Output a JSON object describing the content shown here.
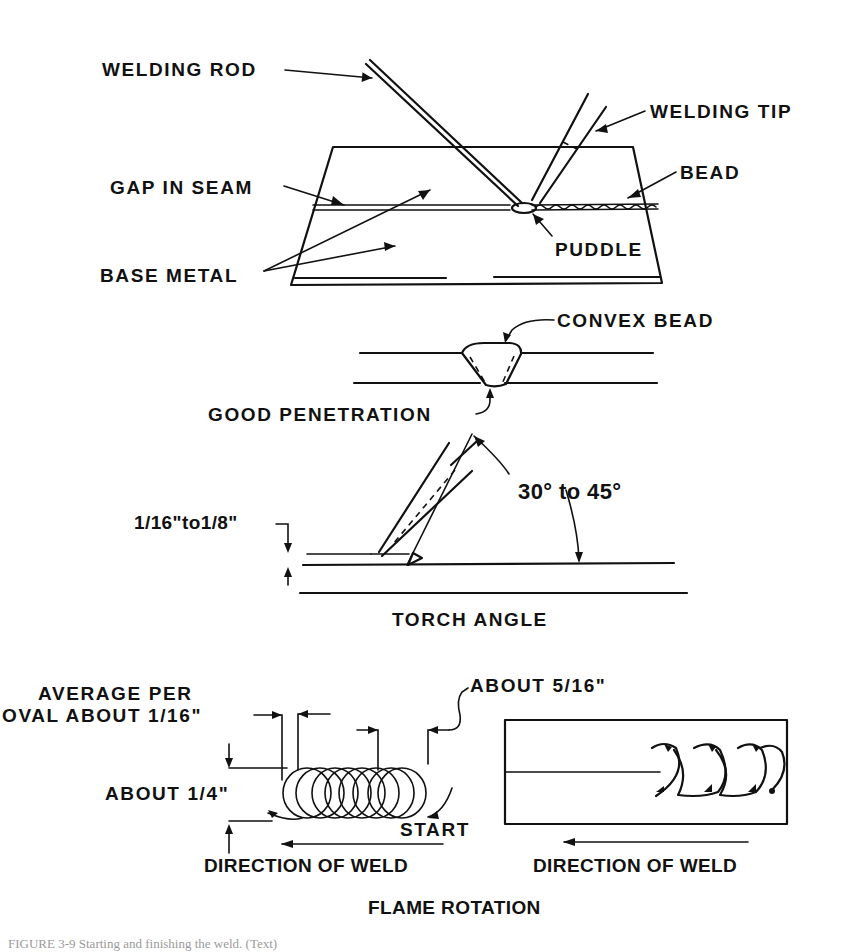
{
  "figure": {
    "panels": {
      "setup": {
        "labels": {
          "welding_rod": "WELDING ROD",
          "welding_tip": "WELDING TIP",
          "gap_in_seam": "GAP IN SEAM",
          "bead": "BEAD",
          "base_metal": "BASE METAL",
          "puddle": "PUDDLE"
        }
      },
      "cross_section": {
        "labels": {
          "convex_bead": "CONVEX BEAD",
          "good_penetration": "GOOD PENETRATION"
        }
      },
      "torch_angle": {
        "title": "TORCH ANGLE",
        "labels": {
          "angle_range": "30° to 45°",
          "tip_distance": "1/16\"to1/8\""
        }
      },
      "flame_rotation": {
        "title": "FLAME ROTATION",
        "labels": {
          "average_per_oval_line1": "AVERAGE PER",
          "average_per_oval_line2": "OVAL ABOUT 1/16\"",
          "about_5_16": "ABOUT 5/16\"",
          "about_1_4": "ABOUT 1/4\"",
          "start": "START",
          "direction_left": "DIRECTION OF WELD",
          "direction_right": "DIRECTION OF WELD"
        }
      }
    },
    "caption": "FIGURE 3-9   Starting and finishing the weld. (Text)"
  }
}
